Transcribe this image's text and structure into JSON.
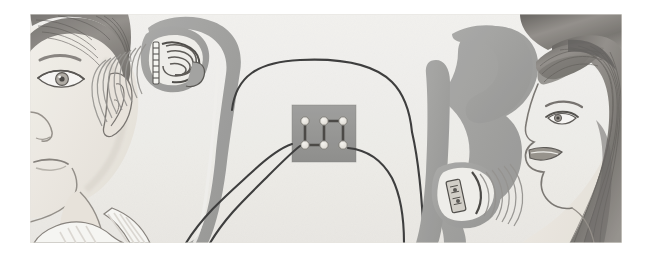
{
  "image": {
    "title": "Telephone handset sound transmission diagram",
    "medium": "pencil and gray wash illustration",
    "width": 648,
    "height": 262,
    "page_background": "#ffffff",
    "plate_background": "#f2f1ee",
    "plate": {
      "x": 30,
      "y": 14,
      "width": 592,
      "height": 229
    }
  },
  "palette": {
    "paper": "#f2f1ee",
    "paper_shadow": "#e8e7e3",
    "handset_gray": "#9b9b99",
    "handset_gray_dark": "#7e7e7c",
    "terminal_gray": "#8e8e8c",
    "terminal_post": "#ece9e3",
    "cord_black": "#2b2b2b",
    "skin": "#eeeae4",
    "skin_shade": "#ded8d0",
    "hair_dark": "#55524e",
    "hair_mid": "#7d7974",
    "hair_light": "#a6a29c",
    "line_pencil": "#5d5a56",
    "wave_gray": "#8c8a86",
    "shirt_white": "#f7f6f3",
    "shirt_stripe": "#dedbd5"
  },
  "scene": {
    "description": "Two children hold telephone handsets facing each other; the left boy listens to the earpiece while the right girl speaks into the mouthpiece. Both handsets are wired to a central terminal block.",
    "elements": [
      {
        "name": "boy-head",
        "label": "Boy listening",
        "position": "left",
        "features": [
          "short dark hair with bangs",
          "eyebrow",
          "detailed eye",
          "ear",
          "nose",
          "mouth",
          "chin",
          "neck",
          "striped collar shirt"
        ]
      },
      {
        "name": "girl-head",
        "label": "Girl speaking",
        "position": "right",
        "features": [
          "long dark flowing hair",
          "bangs",
          "eye in profile",
          "nose",
          "open mouth",
          "chin"
        ]
      },
      {
        "name": "left-handset",
        "label": "Receiver handset held to boy's ear",
        "cutaway": "earpiece cutaway showing coil electromagnet and diaphragm"
      },
      {
        "name": "right-handset",
        "label": "Transmitter handset held to girl's mouth",
        "cutaway": "mouthpiece cutaway showing carbon microphone capsule and diaphragm"
      },
      {
        "name": "terminal-board",
        "label": "Central terminal block",
        "post_count": 6,
        "post_rows": 2,
        "post_columns": 3,
        "wiring": "serpentine zig-zag link between posts; cord in at bottom-left post, cord out at bottom-right post"
      },
      {
        "name": "sound-waves-left",
        "label": "Sound waves leaving earpiece toward boy's ear",
        "arc_count": 9,
        "direction": "right-to-left"
      },
      {
        "name": "sound-waves-right",
        "label": "Sound waves travelling from girl's mouth into mouthpiece",
        "arc_count": 6,
        "direction": "right-to-left"
      },
      {
        "name": "connecting-cords",
        "label": "Pair of cords linking both handsets through the terminal block",
        "cord_count": 4
      }
    ]
  }
}
